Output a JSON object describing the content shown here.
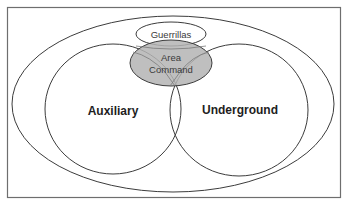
{
  "diagram": {
    "type": "venn",
    "regions": {
      "guerrillas": {
        "label": "Guerrillas"
      },
      "area_command": {
        "label_line1": "Area",
        "label_line2": "Command",
        "fill": "#b4b4b4"
      },
      "auxiliary": {
        "label": "Auxiliary"
      },
      "underground": {
        "label": "Underground"
      }
    },
    "colors": {
      "stroke": "#3c3c3c",
      "background": "#ffffff",
      "frame": "#6e6e6e"
    }
  }
}
